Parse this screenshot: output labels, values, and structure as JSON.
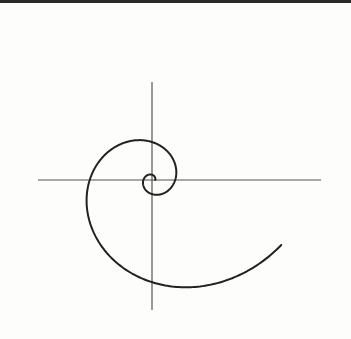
{
  "figure": {
    "colors": {
      "background": "#fdfdfb",
      "axis": "#555555",
      "curve": "#222222",
      "border": "#2a2a2a"
    },
    "origin": {
      "x": 152,
      "y": 180
    },
    "axes": {
      "horizontal": {
        "x1": 38,
        "x2": 321,
        "y": 180
      },
      "vertical": {
        "x": 152,
        "y1": 82,
        "y2": 310
      }
    },
    "spiral": {
      "type": "logarithmic",
      "a": 3.2,
      "growth_per_radian": 0.315,
      "theta_start": 0,
      "theta_end": 12.1,
      "direction": "counterclockwise"
    }
  }
}
